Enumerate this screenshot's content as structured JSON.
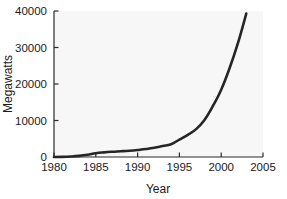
{
  "chart_data": {
    "type": "line",
    "title": "",
    "xlabel": "Year",
    "ylabel": "Megawatts",
    "xlim": [
      1980,
      2005
    ],
    "ylim": [
      0,
      40000
    ],
    "grid": false,
    "legend": null,
    "xticks": [
      1980,
      1985,
      1990,
      1995,
      2000,
      2005
    ],
    "xtick_labels": [
      "1980",
      "1985",
      "1990",
      "1995",
      "2000",
      "2005"
    ],
    "yticks": [
      0,
      10000,
      20000,
      30000,
      40000
    ],
    "ytick_labels": [
      "0",
      "10000",
      "20000",
      "30000",
      "40000"
    ],
    "series": [
      {
        "name": "Cumulative installed capacity",
        "color": "#262626",
        "x": [
          1980,
          1981,
          1982,
          1983,
          1984,
          1985,
          1986,
          1987,
          1988,
          1989,
          1990,
          1991,
          1992,
          1993,
          1994,
          1995,
          1996,
          1997,
          1998,
          1999,
          2000,
          2001,
          2002,
          2003
        ],
        "y": [
          10,
          40,
          130,
          300,
          600,
          1020,
          1270,
          1450,
          1580,
          1730,
          1930,
          2170,
          2510,
          2990,
          3490,
          4780,
          6070,
          7640,
          10150,
          13930,
          18450,
          24320,
          31180,
          39300
        ]
      }
    ]
  },
  "axis_labels": {
    "x_title": "Year",
    "y_title": "Megawatts"
  },
  "colors": {
    "line": "#262626",
    "axis": "#2b2b2b",
    "plot_background": "#f7f7f7",
    "figure_background": "#ffffff",
    "text": "#1a1a1a"
  }
}
